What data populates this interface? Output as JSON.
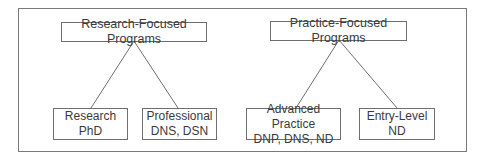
{
  "diagram": {
    "top_nodes": [
      {
        "label": "Research-Focused Programs"
      },
      {
        "label": "Practice-Focused Programs"
      }
    ],
    "leaf_nodes": [
      {
        "line1": "Research",
        "line2": "PhD",
        "parent": "Research-Focused Programs"
      },
      {
        "line1": "Professional",
        "line2": "DNS, DSN",
        "parent": "Research-Focused Programs"
      },
      {
        "line1": "Advanced Practice",
        "line2": "DNP, DNS, ND",
        "parent": "Practice-Focused Programs"
      },
      {
        "line1": "Entry-Level",
        "line2": "ND",
        "parent": "Practice-Focused Programs"
      }
    ],
    "colors": {
      "border": "#6e6e6e",
      "text": "#3a3a3a",
      "background": "#ffffff"
    }
  }
}
